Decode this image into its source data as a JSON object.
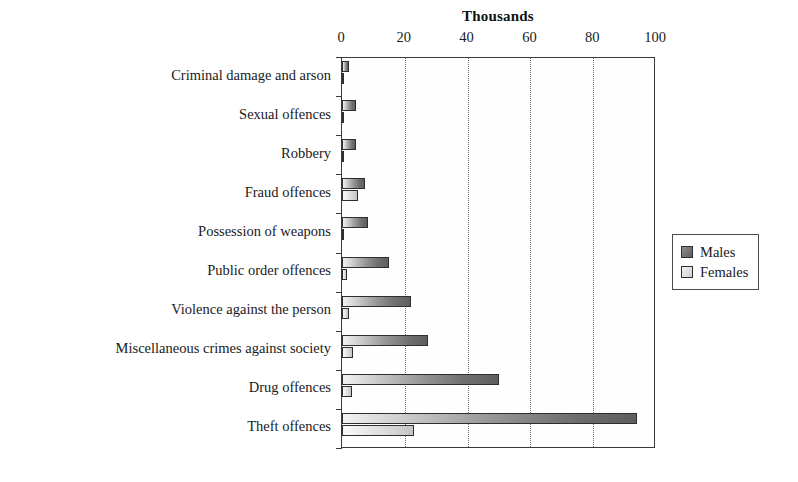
{
  "chart_data": {
    "type": "bar",
    "orientation": "horizontal",
    "title": "Thousands",
    "xlabel": "",
    "ylabel": "",
    "xlim": [
      0,
      100
    ],
    "xticks": [
      0,
      20,
      40,
      60,
      80,
      100
    ],
    "grid": "vertical-dotted",
    "legend_position": "right",
    "categories": [
      "Criminal damage and arson",
      "Sexual offences",
      "Robbery",
      "Fraud offences",
      "Possession of weapons",
      "Public order offences",
      "Violence against the person",
      "Miscellaneous crimes against society",
      "Drug offences",
      "Theft offences"
    ],
    "series": [
      {
        "name": "Males",
        "color": "#707070",
        "values": [
          2.3,
          4.5,
          4.5,
          7.3,
          8.3,
          15.0,
          22.0,
          27.5,
          50.0,
          94.0
        ]
      },
      {
        "name": "Females",
        "color": "#dcdcdc",
        "values": [
          0.4,
          0.2,
          0.4,
          5.0,
          0.6,
          1.5,
          2.3,
          3.5,
          3.2,
          23.0
        ]
      }
    ]
  },
  "legend": {
    "entries": [
      {
        "label": "Males",
        "swatch": "males"
      },
      {
        "label": "Females",
        "swatch": "females"
      }
    ]
  }
}
